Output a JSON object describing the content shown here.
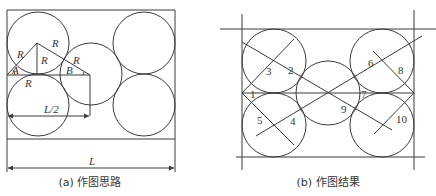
{
  "panels": [
    {
      "id": "a",
      "caption": "(a) 作图思路",
      "labels": {
        "R_left_diag": "R",
        "R_top_diag": "R",
        "R_vertical": "R",
        "R_right_diag": "R",
        "R_bottom": "R",
        "angle_A": "A",
        "angle_B": "B",
        "half_width": "L/2",
        "full_width": "L"
      }
    },
    {
      "id": "b",
      "caption": "(b) 作图结果",
      "point_labels": [
        "1",
        "2",
        "3",
        "4",
        "5",
        "6",
        "7",
        "8",
        "9",
        "10"
      ]
    }
  ],
  "colors": {
    "line": "#3a3a3a",
    "text": "#333333",
    "background": "#ffffff"
  }
}
